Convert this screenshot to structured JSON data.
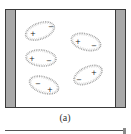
{
  "figure": {
    "caption": "(a)",
    "colors": {
      "plate_fill": "#a9a9a9",
      "outline": "#3a3a3a",
      "dipole_dots": "#9a9a9a",
      "sign": "#222222"
    },
    "plates": [
      {
        "side": "left"
      },
      {
        "side": "right"
      }
    ],
    "dipoles": [
      {
        "cx": 40,
        "cy": 31,
        "rx": 15,
        "ry": 8,
        "angle": -20,
        "plus": "+",
        "minus": "−",
        "plus_pos": [
          33,
          34
        ],
        "minus_pos": [
          51,
          27
        ]
      },
      {
        "cx": 86,
        "cy": 42,
        "rx": 15,
        "ry": 8,
        "angle": 15,
        "plus": "+",
        "minus": "−",
        "plus_pos": [
          78,
          42
        ],
        "minus_pos": [
          94,
          46
        ]
      },
      {
        "cx": 41,
        "cy": 58,
        "rx": 15,
        "ry": 8,
        "angle": 5,
        "plus": "+",
        "minus": "−",
        "plus_pos": [
          32,
          59
        ],
        "minus_pos": [
          49,
          61
        ]
      },
      {
        "cx": 88,
        "cy": 75,
        "rx": 15,
        "ry": 8,
        "angle": -25,
        "plus": "+",
        "minus": "−",
        "plus_pos": [
          94,
          73
        ],
        "minus_pos": [
          79,
          80
        ]
      },
      {
        "cx": 44,
        "cy": 85,
        "rx": 15,
        "ry": 8,
        "angle": 18,
        "plus": "+",
        "minus": "−",
        "plus_pos": [
          50,
          90
        ],
        "minus_pos": [
          38,
          84
        ]
      }
    ]
  }
}
